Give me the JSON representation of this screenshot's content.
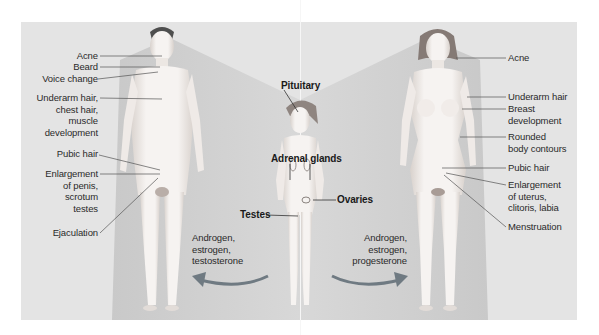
{
  "figure": {
    "colors": {
      "background": "#ffffff",
      "panel": "#e4e4e4",
      "cone_shade": "#cfcfcf",
      "skin": "#f3efec",
      "skin_shadow": "#d9d2cd",
      "male_hair": "#5a5a5a",
      "female_hair": "#8a7f7a",
      "arrow": "#6f7a82",
      "leader_line": "#555555",
      "text": "#2a2a2a"
    },
    "male": {
      "labels": [
        {
          "id": "acne",
          "lines": [
            "Acne"
          ]
        },
        {
          "id": "beard",
          "lines": [
            "Beard"
          ]
        },
        {
          "id": "voice",
          "lines": [
            "Voice change"
          ]
        },
        {
          "id": "underarm",
          "lines": [
            "Underarm hair,",
            "chest hair,",
            "muscle",
            "development"
          ]
        },
        {
          "id": "pubic",
          "lines": [
            "Pubic hair"
          ]
        },
        {
          "id": "enlargement",
          "lines": [
            "Enlargement",
            "of penis,",
            "scrotum",
            "testes"
          ]
        },
        {
          "id": "ejaculation",
          "lines": [
            "Ejaculation"
          ]
        }
      ],
      "hormones": [
        "Androgen,",
        "estrogen,",
        "testosterone"
      ]
    },
    "child": {
      "labels": [
        {
          "id": "pituitary",
          "lines": [
            "Pituitary"
          ]
        },
        {
          "id": "adrenal",
          "lines": [
            "Adrenal glands"
          ]
        },
        {
          "id": "ovaries",
          "lines": [
            "Ovaries"
          ]
        },
        {
          "id": "testes",
          "lines": [
            "Testes"
          ]
        }
      ]
    },
    "female": {
      "labels": [
        {
          "id": "acne",
          "lines": [
            "Acne"
          ]
        },
        {
          "id": "underarm",
          "lines": [
            "Underarm hair"
          ]
        },
        {
          "id": "breast",
          "lines": [
            "Breast",
            "development"
          ]
        },
        {
          "id": "contours",
          "lines": [
            "Rounded",
            "body contours"
          ]
        },
        {
          "id": "pubic",
          "lines": [
            "Pubic hair"
          ]
        },
        {
          "id": "enlargement",
          "lines": [
            "Enlargement",
            "of uterus,",
            "clitoris, labia"
          ]
        },
        {
          "id": "menstruation",
          "lines": [
            "Menstruation"
          ]
        }
      ],
      "hormones": [
        "Androgen,",
        "estrogen,",
        "progesterone"
      ]
    }
  }
}
